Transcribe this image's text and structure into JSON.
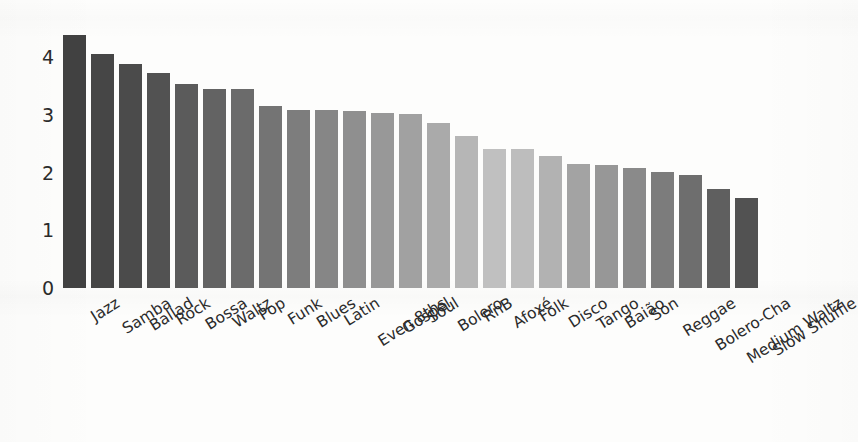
{
  "chart_data": {
    "type": "bar",
    "title": "",
    "subtitle": "",
    "xlabel": "",
    "ylabel": "log10 quantity",
    "ylim": [
      0,
      4.6
    ],
    "yticks": [
      0,
      1,
      2,
      3,
      4
    ],
    "ytick_labels": [
      "0",
      "1",
      "2",
      "3",
      "4"
    ],
    "grid": false,
    "legend": null,
    "legend_position": "none",
    "categories": [
      "Jazz",
      "Samba",
      "Ballad",
      "Rock",
      "Bossa",
      "Waltz",
      "Pop",
      "Funk",
      "Blues",
      "Latin",
      "Even 8ths",
      "Gospel",
      "Soul",
      "Bolero",
      "RnB",
      "Afoxé",
      "Folk",
      "Disco",
      "Tango",
      "Baião",
      "Son",
      "Reggae",
      "Bolero-Cha",
      "Medium Waltz",
      "Slow Shuffle"
    ],
    "values": [
      4.38,
      4.06,
      3.88,
      3.73,
      3.53,
      3.45,
      3.44,
      3.16,
      3.09,
      3.08,
      3.07,
      3.03,
      3.02,
      2.85,
      2.63,
      2.41,
      2.41,
      2.29,
      2.14,
      2.13,
      2.08,
      2.01,
      1.95,
      1.71,
      1.56
    ],
    "bar_colors": [
      "#414141",
      "#464646",
      "#4b4b4b",
      "#525252",
      "#5b5b5b",
      "#636363",
      "#6b6b6b",
      "#747474",
      "#7d7d7d",
      "#868686",
      "#8f8f8f",
      "#989898",
      "#a1a1a1",
      "#aaaaaa",
      "#b6b6b6",
      "#c0c0c0",
      "#bdbdbd",
      "#b2b2b2",
      "#a3a3a3",
      "#979797",
      "#8a8a8a",
      "#7c7c7c",
      "#6e6e6e",
      "#5f5f5f",
      "#525252"
    ],
    "axis_color": "#2b2b2b",
    "background_color": "#fdfdfc"
  }
}
